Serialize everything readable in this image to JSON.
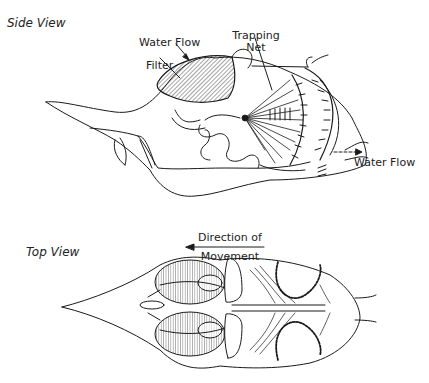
{
  "figure": {
    "side_view": {
      "title": "Side View",
      "labels": {
        "water_flow_in": "Water Flow",
        "filter": "Filter",
        "trapping_net_line1": "Trapping",
        "trapping_net_line2": "Net",
        "water_flow_out": "Water Flow"
      }
    },
    "direction": {
      "line1": "Direction of",
      "line2": "Movement"
    },
    "top_view": {
      "title": "Top View"
    },
    "colors": {
      "ink": "#1a1a1a",
      "background": "#ffffff"
    }
  }
}
